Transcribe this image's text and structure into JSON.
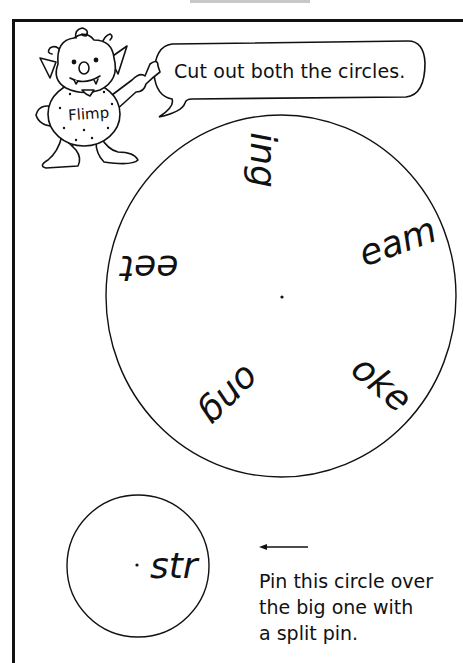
{
  "header": {
    "speech_bubble": "Cut out both the circles."
  },
  "character": {
    "name": "Flimp"
  },
  "big_circle": {
    "segments": [
      {
        "text": "ing",
        "rotation_deg": 90
      },
      {
        "text": "eam",
        "rotation_deg": -20
      },
      {
        "text": "oke",
        "rotation_deg": 40
      },
      {
        "text": "ong",
        "rotation_deg": 135
      },
      {
        "text": "eet",
        "rotation_deg": 180
      }
    ]
  },
  "small_circle": {
    "text": "str"
  },
  "instructions": {
    "arrow": "left-arrow",
    "lines": [
      "Pin this circle over",
      "the big one with",
      "a split pin."
    ]
  }
}
